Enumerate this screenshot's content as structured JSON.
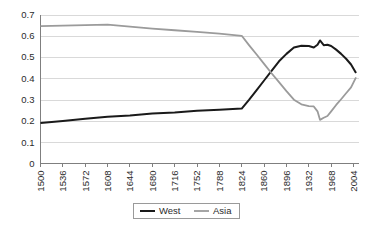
{
  "chart_data": {
    "type": "line",
    "title": "",
    "subtitle": "",
    "xlabel": "",
    "ylabel": "",
    "grid": true,
    "legend_position": "bottom-center",
    "xlim": [
      1500,
      2012
    ],
    "ylim": [
      0,
      0.7
    ],
    "y_ticks": [
      "0",
      "0.1",
      "0.2",
      "0.3",
      "0.4",
      "0.5",
      "0.6",
      "0.7"
    ],
    "y_tick_values": [
      0,
      0.1,
      0.2,
      0.3,
      0.4,
      0.5,
      0.6,
      0.7
    ],
    "x_tick_labels": [
      "1500",
      "1536",
      "1572",
      "1608",
      "1644",
      "1680",
      "1716",
      "1752",
      "1788",
      "1824",
      "1860",
      "1896",
      "1932",
      "1968",
      "2004"
    ],
    "x_tick_values": [
      1500,
      1536,
      1572,
      1608,
      1644,
      1680,
      1716,
      1752,
      1788,
      1824,
      1860,
      1896,
      1932,
      1968,
      2004
    ],
    "x_tick_rotation": -90,
    "series": [
      {
        "name": "West",
        "color": "#1a1a1a",
        "x": [
          1500,
          1536,
          1572,
          1608,
          1644,
          1680,
          1716,
          1752,
          1788,
          1824,
          1836,
          1848,
          1860,
          1872,
          1884,
          1896,
          1908,
          1920,
          1932,
          1940,
          1946,
          1950,
          1956,
          1962,
          1968,
          1976,
          1984,
          1992,
          2000,
          2008
        ],
        "y": [
          0.19,
          0.2,
          0.21,
          0.22,
          0.225,
          0.235,
          0.24,
          0.248,
          0.253,
          0.258,
          0.3,
          0.345,
          0.39,
          0.435,
          0.48,
          0.515,
          0.545,
          0.553,
          0.552,
          0.545,
          0.558,
          0.578,
          0.556,
          0.558,
          0.552,
          0.535,
          0.515,
          0.492,
          0.465,
          0.425
        ]
      },
      {
        "name": "Asia",
        "color": "#9b9b9b",
        "x": [
          1500,
          1536,
          1572,
          1608,
          1644,
          1680,
          1716,
          1752,
          1788,
          1824,
          1836,
          1848,
          1860,
          1872,
          1884,
          1896,
          1908,
          1920,
          1932,
          1940,
          1946,
          1950,
          1956,
          1962,
          1968,
          1976,
          1984,
          1992,
          2000,
          2008
        ],
        "y": [
          0.645,
          0.648,
          0.65,
          0.652,
          0.643,
          0.634,
          0.626,
          0.618,
          0.61,
          0.6,
          0.555,
          0.512,
          0.468,
          0.424,
          0.382,
          0.34,
          0.3,
          0.278,
          0.27,
          0.268,
          0.245,
          0.205,
          0.215,
          0.223,
          0.245,
          0.275,
          0.302,
          0.33,
          0.358,
          0.405
        ]
      }
    ]
  },
  "legend": {
    "entries": [
      {
        "label": "West",
        "color": "#1a1a1a"
      },
      {
        "label": "Asia",
        "color": "#9b9b9b"
      }
    ]
  },
  "style": {
    "grid_color": "#d9d9d9",
    "axis_color": "#7f7f7f",
    "text_color": "#2b2b2b",
    "background": "#ffffff"
  }
}
